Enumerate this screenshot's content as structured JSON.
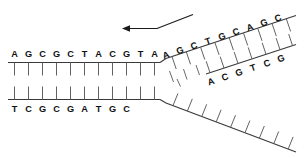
{
  "figure": {
    "background_color": "#ffffff",
    "ink_color": "#111111",
    "line_color": "#3a3a3a",
    "rung_color": "#5a5a5a",
    "width": 305,
    "height": 158
  },
  "strands": {
    "top_parental": {
      "name": "top-parental-strand",
      "sequence": [
        "A",
        "G",
        "C",
        "G",
        "C",
        "T",
        "A",
        "C",
        "G",
        "T",
        "A"
      ],
      "orientation": "horizontal",
      "letters_above": true
    },
    "bottom_parental": {
      "name": "bottom-parental-strand",
      "sequence": [
        "T",
        "C",
        "G",
        "C",
        "G",
        "A",
        "T",
        "G",
        "C"
      ],
      "orientation": "horizontal",
      "letters_below": true
    },
    "leading_upper": {
      "name": "leading-strand-upper-branch",
      "sequence": [
        "A",
        "G",
        "C",
        "T",
        "G",
        "C",
        "A",
        "G",
        "C"
      ],
      "orientation": "diagonal-up-right",
      "letters_below": true
    },
    "lagging_fragment": {
      "name": "okazaki-fragment-strand",
      "sequence": [
        "A",
        "C",
        "G",
        "T",
        "C",
        "G"
      ],
      "orientation": "diagonal-up-right",
      "letters_below": true
    },
    "lower_template": {
      "name": "lower-template-strand",
      "sequence": [],
      "orientation": "diagonal-down-right",
      "letters": "none"
    }
  },
  "arrow": {
    "name": "replication-direction-arrow",
    "direction": "left",
    "label": ""
  },
  "junction": {
    "name": "replication-fork-junction",
    "dash_count": 4
  }
}
